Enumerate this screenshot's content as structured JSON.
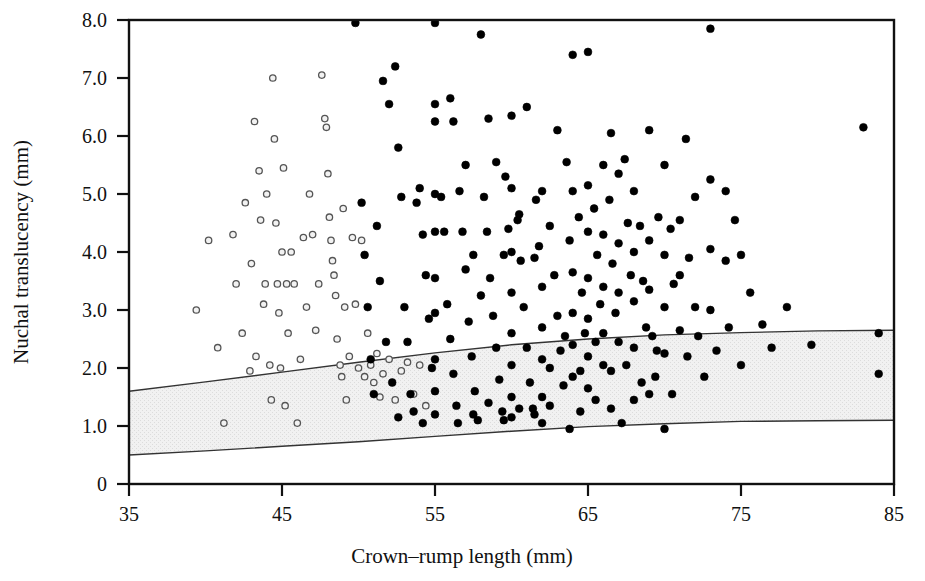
{
  "chart_data": {
    "type": "scatter",
    "title": "",
    "xlabel": "Crown–rump length (mm)",
    "ylabel": "Nuchal translucency (mm)",
    "xlim": [
      35,
      85
    ],
    "ylim": [
      0,
      8.0
    ],
    "xticks": [
      35,
      45,
      55,
      65,
      75,
      85
    ],
    "xtick_labels": [
      "35",
      "45",
      "55",
      "65",
      "75",
      "85"
    ],
    "yticks": [
      0,
      1.0,
      2.0,
      3.0,
      4.0,
      5.0,
      6.0,
      7.0,
      8.0
    ],
    "ytick_labels": [
      "0",
      "1.0",
      "2.0",
      "3.0",
      "4.0",
      "5.0",
      "6.0",
      "7.0",
      "8.0"
    ],
    "grid": false,
    "legend": null,
    "annotations": [],
    "reference_band": {
      "name": "normal-range-band",
      "fill": "#efefef",
      "stroke": "#333333",
      "description": "Shaded reference band between 5th and 95th centile curves of nuchal translucency versus crown-rump length",
      "upper_curve": [
        [
          35,
          1.6
        ],
        [
          40,
          1.76
        ],
        [
          45,
          1.93
        ],
        [
          50,
          2.1
        ],
        [
          55,
          2.26
        ],
        [
          60,
          2.4
        ],
        [
          65,
          2.5
        ],
        [
          70,
          2.57
        ],
        [
          75,
          2.61
        ],
        [
          80,
          2.64
        ],
        [
          85,
          2.65
        ]
      ],
      "lower_curve": [
        [
          35,
          0.5
        ],
        [
          40,
          0.57
        ],
        [
          45,
          0.65
        ],
        [
          50,
          0.73
        ],
        [
          55,
          0.82
        ],
        [
          60,
          0.91
        ],
        [
          65,
          0.99
        ],
        [
          70,
          1.04
        ],
        [
          75,
          1.08
        ],
        [
          80,
          1.09
        ],
        [
          85,
          1.1
        ]
      ]
    },
    "series": [
      {
        "name": "open-markers",
        "marker": "open-circle",
        "marker_fill": "#f2f2f2",
        "marker_stroke": "#555555",
        "points": [
          [
            39.4,
            3.0
          ],
          [
            40.2,
            4.2
          ],
          [
            40.8,
            2.35
          ],
          [
            41.2,
            1.05
          ],
          [
            41.8,
            4.3
          ],
          [
            42.0,
            3.45
          ],
          [
            42.4,
            2.6
          ],
          [
            42.6,
            4.85
          ],
          [
            42.9,
            1.95
          ],
          [
            43.0,
            3.8
          ],
          [
            43.2,
            6.25
          ],
          [
            43.3,
            2.2
          ],
          [
            43.5,
            5.4
          ],
          [
            43.6,
            4.55
          ],
          [
            43.8,
            3.1
          ],
          [
            43.9,
            3.45
          ],
          [
            44.0,
            5.0
          ],
          [
            44.2,
            2.05
          ],
          [
            44.3,
            1.45
          ],
          [
            44.4,
            7.0
          ],
          [
            44.5,
            5.95
          ],
          [
            44.6,
            4.5
          ],
          [
            44.7,
            3.45
          ],
          [
            44.8,
            2.95
          ],
          [
            44.9,
            2.0
          ],
          [
            45.0,
            4.0
          ],
          [
            45.1,
            5.45
          ],
          [
            45.2,
            1.35
          ],
          [
            45.3,
            3.45
          ],
          [
            45.4,
            2.6
          ],
          [
            45.6,
            4.0
          ],
          [
            45.8,
            3.45
          ],
          [
            46.0,
            1.05
          ],
          [
            46.2,
            2.15
          ],
          [
            46.4,
            4.25
          ],
          [
            46.6,
            3.05
          ],
          [
            46.8,
            5.0
          ],
          [
            47.0,
            4.3
          ],
          [
            47.2,
            2.65
          ],
          [
            47.4,
            3.45
          ],
          [
            47.6,
            7.05
          ],
          [
            47.8,
            6.3
          ],
          [
            47.9,
            6.15
          ],
          [
            48.0,
            5.35
          ],
          [
            48.1,
            4.6
          ],
          [
            48.2,
            4.2
          ],
          [
            48.3,
            3.85
          ],
          [
            48.4,
            3.6
          ],
          [
            48.5,
            3.25
          ],
          [
            48.6,
            2.5
          ],
          [
            48.8,
            2.05
          ],
          [
            48.9,
            1.85
          ],
          [
            49.0,
            4.75
          ],
          [
            49.1,
            3.05
          ],
          [
            49.2,
            1.45
          ],
          [
            49.4,
            2.2
          ],
          [
            49.6,
            4.25
          ],
          [
            49.8,
            3.1
          ],
          [
            50.0,
            2.0
          ],
          [
            50.2,
            4.2
          ],
          [
            50.4,
            1.85
          ],
          [
            50.6,
            2.6
          ],
          [
            50.8,
            2.05
          ],
          [
            51.0,
            1.75
          ],
          [
            51.2,
            2.25
          ],
          [
            51.4,
            1.5
          ],
          [
            51.6,
            1.9
          ],
          [
            52.0,
            2.15
          ],
          [
            52.4,
            1.45
          ],
          [
            52.8,
            1.95
          ],
          [
            53.2,
            2.1
          ],
          [
            53.6,
            1.55
          ],
          [
            54.0,
            2.05
          ],
          [
            54.4,
            1.35
          ]
        ]
      },
      {
        "name": "filled-markers",
        "marker": "filled-circle",
        "marker_fill": "#000000",
        "marker_stroke": "#000000",
        "points": [
          [
            49.8,
            7.95
          ],
          [
            51.6,
            6.95
          ],
          [
            52.0,
            6.55
          ],
          [
            52.4,
            7.2
          ],
          [
            52.6,
            5.8
          ],
          [
            52.8,
            4.95
          ],
          [
            53.0,
            3.05
          ],
          [
            53.2,
            2.45
          ],
          [
            53.4,
            1.55
          ],
          [
            53.6,
            1.25
          ],
          [
            54.0,
            5.1
          ],
          [
            54.2,
            4.3
          ],
          [
            54.4,
            3.6
          ],
          [
            54.6,
            2.85
          ],
          [
            54.8,
            2.0
          ],
          [
            55.0,
            7.95
          ],
          [
            55.0,
            6.55
          ],
          [
            55.0,
            6.25
          ],
          [
            55.0,
            5.0
          ],
          [
            55.0,
            4.35
          ],
          [
            55.0,
            3.55
          ],
          [
            55.0,
            2.95
          ],
          [
            55.0,
            2.15
          ],
          [
            55.0,
            1.6
          ],
          [
            55.0,
            1.2
          ],
          [
            55.4,
            4.95
          ],
          [
            55.6,
            4.35
          ],
          [
            55.8,
            3.1
          ],
          [
            56.0,
            2.5
          ],
          [
            56.2,
            1.9
          ],
          [
            56.4,
            1.35
          ],
          [
            56.6,
            5.05
          ],
          [
            56.8,
            4.35
          ],
          [
            57.0,
            3.7
          ],
          [
            57.2,
            2.8
          ],
          [
            57.4,
            2.2
          ],
          [
            57.6,
            1.6
          ],
          [
            57.8,
            1.1
          ],
          [
            58.0,
            7.75
          ],
          [
            58.2,
            4.95
          ],
          [
            58.4,
            4.35
          ],
          [
            58.6,
            3.55
          ],
          [
            58.8,
            2.9
          ],
          [
            59.0,
            2.35
          ],
          [
            59.2,
            1.8
          ],
          [
            59.4,
            1.25
          ],
          [
            59.6,
            5.3
          ],
          [
            59.8,
            4.4
          ],
          [
            60.0,
            6.35
          ],
          [
            60.0,
            5.1
          ],
          [
            60.0,
            4.0
          ],
          [
            60.0,
            3.3
          ],
          [
            60.0,
            2.6
          ],
          [
            60.0,
            2.05
          ],
          [
            60.0,
            1.5
          ],
          [
            60.0,
            1.15
          ],
          [
            60.4,
            4.55
          ],
          [
            60.6,
            3.85
          ],
          [
            60.8,
            3.05
          ],
          [
            61.0,
            2.35
          ],
          [
            61.2,
            1.75
          ],
          [
            61.4,
            1.3
          ],
          [
            61.6,
            4.9
          ],
          [
            61.8,
            4.1
          ],
          [
            62.0,
            5.05
          ],
          [
            62.0,
            3.4
          ],
          [
            62.0,
            2.7
          ],
          [
            62.0,
            2.15
          ],
          [
            62.0,
            1.5
          ],
          [
            62.0,
            1.05
          ],
          [
            62.5,
            4.45
          ],
          [
            62.8,
            3.6
          ],
          [
            63.0,
            2.9
          ],
          [
            63.2,
            2.3
          ],
          [
            63.4,
            1.7
          ],
          [
            63.6,
            5.55
          ],
          [
            63.8,
            4.2
          ],
          [
            64.0,
            7.4
          ],
          [
            64.0,
            5.05
          ],
          [
            64.0,
            3.65
          ],
          [
            64.0,
            2.95
          ],
          [
            64.0,
            2.4
          ],
          [
            64.0,
            1.85
          ],
          [
            64.4,
            4.6
          ],
          [
            64.6,
            3.3
          ],
          [
            64.8,
            2.6
          ],
          [
            65.0,
            7.45
          ],
          [
            65.0,
            5.15
          ],
          [
            65.0,
            4.35
          ],
          [
            65.0,
            3.55
          ],
          [
            65.0,
            2.85
          ],
          [
            65.0,
            2.2
          ],
          [
            65.0,
            1.65
          ],
          [
            65.4,
            4.75
          ],
          [
            65.6,
            3.95
          ],
          [
            65.8,
            3.1
          ],
          [
            66.0,
            5.5
          ],
          [
            66.0,
            4.3
          ],
          [
            66.0,
            3.4
          ],
          [
            66.0,
            2.6
          ],
          [
            66.0,
            2.05
          ],
          [
            66.4,
            4.9
          ],
          [
            66.6,
            3.8
          ],
          [
            66.8,
            2.95
          ],
          [
            67.0,
            5.35
          ],
          [
            67.0,
            4.15
          ],
          [
            67.0,
            3.3
          ],
          [
            67.0,
            2.45
          ],
          [
            67.4,
            5.6
          ],
          [
            67.6,
            4.5
          ],
          [
            67.8,
            3.6
          ],
          [
            68.0,
            5.05
          ],
          [
            68.0,
            4.0
          ],
          [
            68.0,
            3.15
          ],
          [
            68.0,
            2.35
          ],
          [
            68.4,
            4.45
          ],
          [
            68.6,
            3.5
          ],
          [
            68.8,
            2.7
          ],
          [
            69.0,
            6.1
          ],
          [
            69.0,
            4.2
          ],
          [
            69.0,
            3.35
          ],
          [
            69.2,
            2.55
          ],
          [
            69.4,
            1.85
          ],
          [
            69.6,
            4.6
          ],
          [
            70.0,
            5.5
          ],
          [
            70.0,
            3.95
          ],
          [
            70.0,
            3.05
          ],
          [
            70.0,
            2.25
          ],
          [
            70.0,
            0.95
          ],
          [
            70.4,
            4.4
          ],
          [
            70.6,
            3.45
          ],
          [
            71.0,
            4.55
          ],
          [
            71.0,
            3.6
          ],
          [
            71.0,
            2.65
          ],
          [
            71.4,
            5.95
          ],
          [
            71.6,
            3.9
          ],
          [
            72.0,
            4.95
          ],
          [
            72.0,
            3.05
          ],
          [
            72.2,
            2.55
          ],
          [
            72.6,
            1.85
          ],
          [
            73.0,
            7.85
          ],
          [
            73.0,
            5.25
          ],
          [
            73.0,
            4.05
          ],
          [
            73.0,
            3.0
          ],
          [
            73.4,
            2.3
          ],
          [
            74.0,
            5.05
          ],
          [
            74.0,
            3.85
          ],
          [
            74.2,
            2.7
          ],
          [
            74.6,
            4.55
          ],
          [
            75.0,
            3.95
          ],
          [
            75.0,
            2.05
          ],
          [
            75.6,
            3.3
          ],
          [
            76.4,
            2.75
          ],
          [
            77.0,
            2.35
          ],
          [
            78.0,
            3.05
          ],
          [
            79.6,
            2.4
          ],
          [
            83.0,
            6.15
          ],
          [
            84.0,
            2.6
          ],
          [
            84.0,
            1.9
          ],
          [
            50.2,
            4.85
          ],
          [
            50.4,
            3.95
          ],
          [
            50.6,
            3.05
          ],
          [
            50.8,
            2.15
          ],
          [
            51.0,
            1.55
          ],
          [
            51.2,
            4.45
          ],
          [
            51.4,
            3.5
          ],
          [
            51.8,
            2.45
          ],
          [
            52.2,
            1.75
          ],
          [
            52.6,
            1.15
          ],
          [
            53.8,
            4.85
          ],
          [
            54.2,
            1.05
          ],
          [
            56.0,
            6.65
          ],
          [
            56.2,
            6.25
          ],
          [
            57.0,
            5.5
          ],
          [
            58.5,
            6.3
          ],
          [
            59.0,
            5.55
          ],
          [
            61.0,
            6.5
          ],
          [
            63.0,
            6.1
          ],
          [
            66.5,
            6.05
          ],
          [
            57.5,
            3.95
          ],
          [
            58.0,
            3.25
          ],
          [
            59.5,
            3.95
          ],
          [
            60.5,
            4.65
          ],
          [
            61.5,
            3.9
          ],
          [
            62.5,
            2.0
          ],
          [
            63.5,
            2.55
          ],
          [
            64.5,
            1.95
          ],
          [
            65.5,
            2.45
          ],
          [
            66.5,
            1.95
          ],
          [
            67.5,
            2.05
          ],
          [
            68.5,
            1.75
          ],
          [
            69.5,
            2.3
          ],
          [
            70.5,
            1.55
          ],
          [
            71.5,
            2.2
          ],
          [
            56.5,
            1.05
          ],
          [
            57.5,
            1.2
          ],
          [
            58.5,
            1.4
          ],
          [
            59.5,
            1.1
          ],
          [
            60.5,
            1.3
          ],
          [
            61.5,
            1.2
          ],
          [
            62.5,
            1.35
          ],
          [
            64.5,
            1.25
          ],
          [
            65.5,
            1.45
          ],
          [
            66.5,
            1.3
          ],
          [
            68.0,
            1.45
          ],
          [
            69.0,
            1.55
          ],
          [
            67.2,
            1.05
          ],
          [
            63.8,
            0.95
          ]
        ]
      }
    ]
  },
  "axes": {
    "xlabel": "Crown–rump length (mm)",
    "ylabel": "Nuchal translucency (mm)"
  }
}
